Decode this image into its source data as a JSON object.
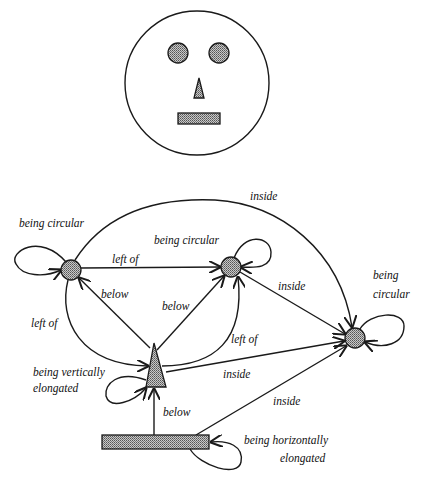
{
  "face": {
    "description": "Schematic face: circle with two circular eyes, triangular nose, rectangular mouth",
    "fill_color": "#9a9a9a"
  },
  "graph": {
    "nodes": [
      {
        "id": "left-eye",
        "shape": "circle",
        "property": "being circular"
      },
      {
        "id": "right-eye",
        "shape": "circle",
        "property": "being circular"
      },
      {
        "id": "face",
        "shape": "circle",
        "property_line1": "being",
        "property_line2": "circular"
      },
      {
        "id": "nose",
        "shape": "triangle",
        "property_line1": "being vertically",
        "property_line2": "elongated"
      },
      {
        "id": "mouth",
        "shape": "rectangle",
        "property_line1": "being horizontally",
        "property_line2": "elongated"
      }
    ],
    "edges": [
      {
        "from": "left-eye",
        "to": "face",
        "label": "inside"
      },
      {
        "from": "left-eye",
        "to": "right-eye",
        "label": "left of"
      },
      {
        "from": "right-eye",
        "to": "face",
        "label": "inside"
      },
      {
        "from": "nose",
        "to": "left-eye",
        "label": "below"
      },
      {
        "from": "nose",
        "to": "right-eye",
        "label": "below"
      },
      {
        "from": "left-eye",
        "to": "nose",
        "label": "left of"
      },
      {
        "from": "nose",
        "to": "right-eye",
        "label": "left of"
      },
      {
        "from": "nose",
        "to": "face",
        "label": "inside"
      },
      {
        "from": "mouth",
        "to": "nose",
        "label": "below"
      },
      {
        "from": "mouth",
        "to": "face",
        "label": "inside"
      }
    ],
    "labels": {
      "left_eye_prop": "being circular",
      "right_eye_prop": "being circular",
      "face_prop_1": "being",
      "face_prop_2": "circular",
      "nose_prop_1": "being vertically",
      "nose_prop_2": "elongated",
      "mouth_prop_1": "being horizontally",
      "mouth_prop_2": "elongated",
      "edge_inside_top": "inside",
      "edge_left_of_eyes": "left of",
      "edge_inside_right_eye": "inside",
      "edge_below_left": "below",
      "edge_below_right": "below",
      "edge_left_of_left": "left of",
      "edge_left_of_right": "left of",
      "edge_inside_nose": "inside",
      "edge_below_mouth": "below",
      "edge_inside_mouth": "inside"
    }
  }
}
